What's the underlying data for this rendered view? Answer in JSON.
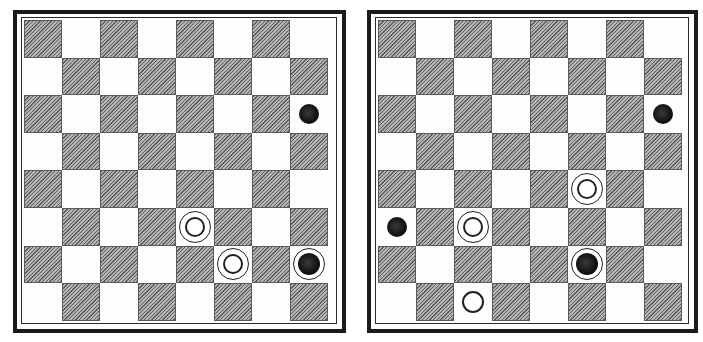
{
  "figure": {
    "colors": {
      "dark_square": "#8f8f8f",
      "light_square": "#fdfdfb",
      "frame": "#1a1a1a",
      "black_piece": "#111111",
      "white_piece": "#ffffff"
    },
    "legend": {
      "black-man": "Black single piece (solid dark disc)",
      "black-king": "Black king (dark disc inside ring)",
      "white-man": "White single piece (single ring)",
      "white-king": "White king (double ring)"
    }
  },
  "boards": [
    {
      "name": "board-left",
      "rows": 8,
      "cols": 8,
      "dark_on": "even-sum",
      "frame": {
        "x": 13,
        "y": 10,
        "w": 333,
        "h": 323
      },
      "inner": {
        "x": 21,
        "y": 17,
        "w": 316,
        "h": 307
      },
      "grid_origin": {
        "x": 24,
        "y": 20
      },
      "pieces": [
        {
          "row": 2,
          "col": 7,
          "type": "black-man"
        },
        {
          "row": 5,
          "col": 4,
          "type": "white-king"
        },
        {
          "row": 6,
          "col": 5,
          "type": "white-king"
        },
        {
          "row": 6,
          "col": 7,
          "type": "black-king"
        }
      ]
    },
    {
      "name": "board-right",
      "rows": 8,
      "cols": 8,
      "dark_on": "even-sum",
      "frame": {
        "x": 367,
        "y": 10,
        "w": 331,
        "h": 323
      },
      "inner": {
        "x": 375,
        "y": 17,
        "w": 314,
        "h": 307
      },
      "grid_origin": {
        "x": 378,
        "y": 20
      },
      "pieces": [
        {
          "row": 2,
          "col": 7,
          "type": "black-man"
        },
        {
          "row": 4,
          "col": 5,
          "type": "white-king"
        },
        {
          "row": 5,
          "col": 0,
          "type": "black-man"
        },
        {
          "row": 5,
          "col": 2,
          "type": "white-king"
        },
        {
          "row": 6,
          "col": 5,
          "type": "black-king"
        },
        {
          "row": 7,
          "col": 2,
          "type": "white-man"
        }
      ]
    }
  ]
}
